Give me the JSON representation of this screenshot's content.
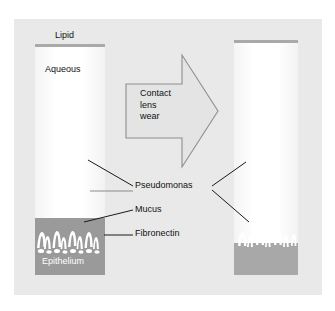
{
  "figure": {
    "type": "scientific-diagram",
    "background_color": "#e9e9e9",
    "panels": [
      {
        "id": "left",
        "name": "pre-contact-lens-wear",
        "layers": [
          "Lipid",
          "Aqueous",
          "Mucus",
          "Fibronectin",
          "Epithelium"
        ]
      },
      {
        "id": "right",
        "name": "post-contact-lens-wear",
        "layers": [
          "Lipid",
          "Aqueous",
          "Epithelium"
        ]
      }
    ]
  },
  "labels": {
    "lipid": "Lipid",
    "aqueous": "Aqueous",
    "pseudomonas": "Pseudomonas",
    "mucus": "Mucus",
    "fibronectin": "Fibronectin",
    "epithelium": "Epithelium"
  },
  "arrow": {
    "text": "Contact\nlens\nwear",
    "direction": "right",
    "fill_color": "#e4e4e4",
    "stroke_color": "#8d8d8d"
  },
  "colors": {
    "panel_background": "#e9e9e9",
    "lipid_bar": "#a9a9a9",
    "epithelium_left": "#9a9a9a",
    "epithelium_right": "#a8a8a8",
    "tear_film": "#ffffff",
    "leader_line": "#1a1a1a",
    "leader_line_light": "#8a8a8a",
    "label_text": "#111111",
    "epithelium_label_text": "#ffffff"
  }
}
